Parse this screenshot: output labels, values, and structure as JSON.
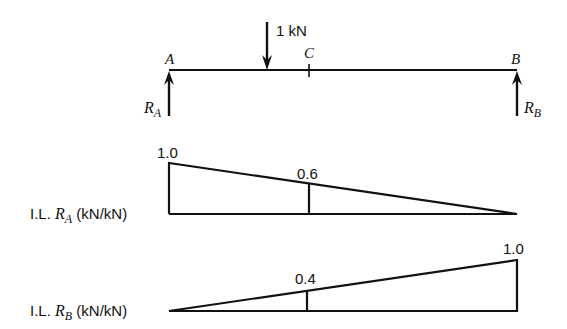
{
  "beam": {
    "load_label": "1 kN",
    "support_a_label": "A",
    "support_b_label": "B",
    "point_c_label": "C",
    "reaction_a": {
      "symbol": "R",
      "sub": "A"
    },
    "reaction_b": {
      "symbol": "R",
      "sub": "B"
    }
  },
  "il_ra": {
    "prefix": "I.L. ",
    "symbol": "R",
    "sub": "A",
    "suffix": " (kN/kN)",
    "value_at_a": "1.0",
    "value_at_c": "0.6"
  },
  "il_rb": {
    "prefix": "I.L. ",
    "symbol": "R",
    "sub": "B",
    "suffix": " (kN/kN)",
    "value_at_c": "0.4",
    "value_at_b": "1.0"
  },
  "colors": {
    "ink": "#111111",
    "background": "#ffffff"
  }
}
